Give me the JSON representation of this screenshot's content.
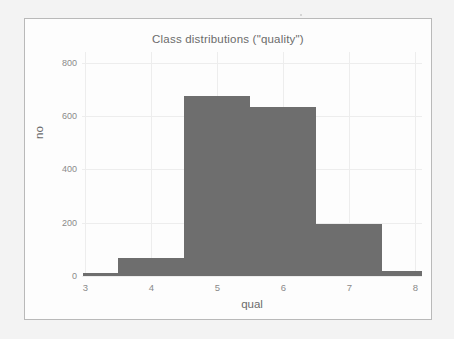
{
  "chart_data": {
    "type": "bar",
    "title": "Class distributions (\"quality\")",
    "xlabel": "qual",
    "ylabel": "no",
    "grid": true,
    "legend": false,
    "xlim": [
      2.95,
      8.1
    ],
    "ylim": [
      0,
      840
    ],
    "xticks": [
      "3",
      "4",
      "5",
      "6",
      "7",
      "8"
    ],
    "xtick_values": [
      3,
      4,
      5,
      6,
      7,
      8
    ],
    "yticks": [
      "0",
      "200",
      "400",
      "600",
      "800"
    ],
    "ytick_values": [
      0,
      200,
      400,
      600,
      800
    ],
    "bin_width": 1,
    "categories": [
      "3",
      "4",
      "5",
      "6",
      "7",
      "8"
    ],
    "values": [
      10,
      66,
      675,
      635,
      195,
      18
    ],
    "bars": [
      {
        "label": "3",
        "start": 2.97,
        "end": 3.5,
        "value": 10
      },
      {
        "label": "4",
        "start": 3.5,
        "end": 4.5,
        "value": 66
      },
      {
        "label": "5",
        "start": 4.5,
        "end": 5.5,
        "value": 675
      },
      {
        "label": "6",
        "start": 5.5,
        "end": 6.5,
        "value": 635
      },
      {
        "label": "7",
        "start": 6.5,
        "end": 7.5,
        "value": 195
      },
      {
        "label": "8",
        "start": 7.5,
        "end": 8.1,
        "value": 18
      }
    ],
    "colors": {
      "bar_fill": "#6e6e6e",
      "grid": "#ededed",
      "text": "#6b6b6b",
      "tick_text": "#8a8a8a",
      "panel_background": "#fdfdfd",
      "panel_border": "#b9b9b9",
      "page_background": "#f3f3f3"
    }
  }
}
